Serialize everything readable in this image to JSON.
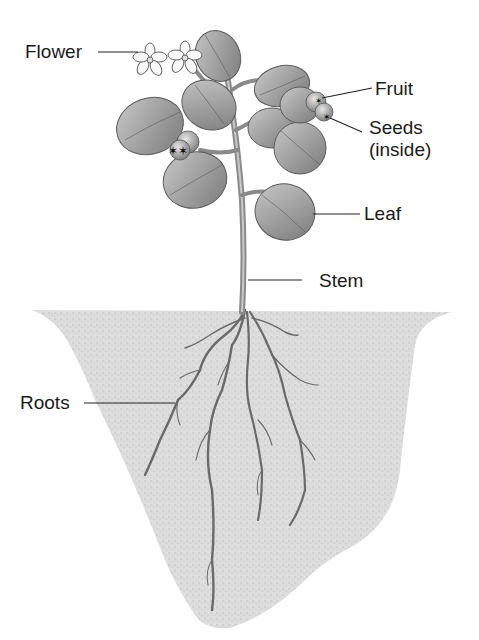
{
  "labels": {
    "flower": "Flower",
    "fruit": "Fruit",
    "seeds": "Seeds",
    "seeds_note": "(inside)",
    "leaf": "Leaf",
    "stem": "Stem",
    "roots": "Roots"
  },
  "colors": {
    "soil": "#d9d9d9",
    "leaf": "#9a9a9a",
    "leaf_dark": "#6e6e6e",
    "stem": "#8a8a8a",
    "line": "#222222",
    "text": "#1a1a1a"
  }
}
